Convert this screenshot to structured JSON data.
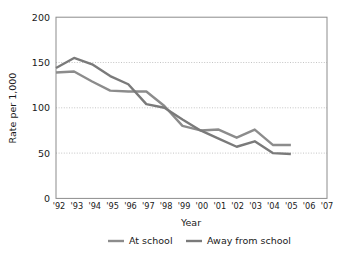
{
  "chart_data": {
    "type": "line",
    "title": "",
    "xlabel": "Year",
    "ylabel": "Rate per 1,000",
    "x": [
      "'92",
      "'93",
      "'94",
      "'95",
      "'96",
      "'97",
      "'98",
      "'99",
      "'00",
      "'01",
      "'02",
      "'03",
      "'04",
      "'05",
      "'06",
      "'07"
    ],
    "categories": [
      "'92",
      "'93",
      "'94",
      "'95",
      "'96",
      "'97",
      "'98",
      "'99",
      "'00",
      "'01",
      "'02",
      "'03",
      "'04",
      "'05",
      "'06",
      "'07"
    ],
    "xlim": [
      "'92",
      "'07"
    ],
    "ylim": [
      0,
      200
    ],
    "yticks": [
      0,
      50,
      100,
      150,
      200
    ],
    "ytick_labels": [
      "0",
      "50",
      "100",
      "150",
      "200"
    ],
    "grid": true,
    "grid_axis": "y",
    "legend_position": "bottom",
    "series": [
      {
        "name": "At school",
        "color": "#8c8c8c",
        "values": [
          139,
          140,
          129,
          119,
          118,
          118,
          102,
          80,
          75,
          76,
          67,
          76,
          59,
          59,
          null,
          null
        ]
      },
      {
        "name": "Away from school",
        "color": "#7a7a7a",
        "values": [
          144,
          155,
          148,
          135,
          126,
          104,
          100,
          87,
          75,
          66,
          57,
          63,
          50,
          49,
          null,
          null
        ]
      }
    ]
  },
  "axis": {
    "ylabel": "Rate per 1,000",
    "xlabel": "Year",
    "ytick_labels": [
      "200",
      "150",
      "100",
      "50",
      "0"
    ],
    "xtick_labels": [
      "'92",
      "'93",
      "'94",
      "'95",
      "'96",
      "'97",
      "'98",
      "'99",
      "'00",
      "'01",
      "'02",
      "'03",
      "'04",
      "'05",
      "'06",
      "'07"
    ]
  },
  "legend": {
    "items": [
      {
        "label": "At school",
        "color": "#8c8c8c"
      },
      {
        "label": "Away from school",
        "color": "#7a7a7a"
      }
    ]
  },
  "colors": {
    "series_at_school": "#8c8c8c",
    "series_away_from_school": "#7a7a7a",
    "gridline": "#b5b5b5",
    "frame": "#8c8c8c",
    "text": "#1a1a1a",
    "background": "#ffffff"
  }
}
